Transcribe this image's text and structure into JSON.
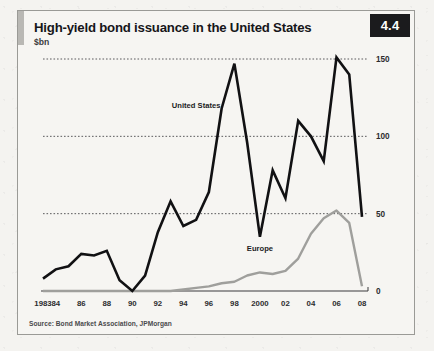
{
  "figure": {
    "number": "4.4",
    "title": "High-yield bond issuance in the United States",
    "units": "$bn",
    "source": "Source: Bond Market Association, JPMorgan"
  },
  "chart_data": {
    "type": "line",
    "title": "High-yield bond issuance in the United States",
    "subtitle": "$bn",
    "xlabel": "",
    "ylabel": "$bn",
    "ylim": [
      0,
      150
    ],
    "yticks": [
      0,
      50,
      100,
      150
    ],
    "ytick_labels": [
      "0",
      "50",
      "100",
      "150"
    ],
    "grid": "horizontal-dotted",
    "legend": "inline-labels",
    "x": [
      1983,
      1984,
      1985,
      1986,
      1987,
      1988,
      1989,
      1990,
      1991,
      1992,
      1993,
      1994,
      1995,
      1996,
      1997,
      1998,
      1999,
      2000,
      2001,
      2002,
      2003,
      2004,
      2005,
      2006,
      2007,
      2008
    ],
    "xtick_values": [
      1983,
      1984,
      1986,
      1988,
      1990,
      1992,
      1994,
      1996,
      1998,
      2000,
      2002,
      2004,
      2006,
      2008
    ],
    "xtick_labels": [
      "1983",
      "84",
      "86",
      "88",
      "90",
      "92",
      "94",
      "96",
      "98",
      "2000",
      "02",
      "04",
      "06",
      "08"
    ],
    "series": [
      {
        "name": "United States",
        "color": "#111113",
        "label_x": 1995,
        "label_y": 118,
        "values": [
          8,
          14,
          16,
          24,
          23,
          26,
          7,
          0,
          10,
          38,
          58,
          42,
          46,
          64,
          118,
          147,
          96,
          35,
          78,
          60,
          110,
          100,
          84,
          151,
          140,
          48
        ]
      },
      {
        "name": "Europe",
        "color": "#9f9f9c",
        "label_x": 2000,
        "label_y": 26,
        "values": [
          0,
          0,
          0,
          0,
          0,
          0,
          0,
          0,
          0,
          0,
          0,
          1,
          2,
          3,
          5,
          6,
          10,
          12,
          11,
          13,
          21,
          37,
          47,
          52,
          44,
          3
        ]
      }
    ]
  }
}
